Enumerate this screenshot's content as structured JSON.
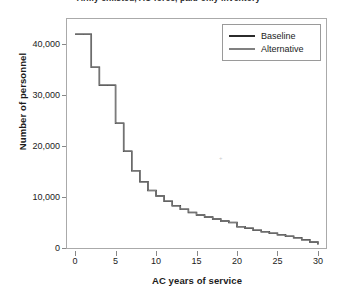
{
  "chart_data": {
    "type": "line",
    "title": "Army enlisted, AC force, paid-only inventory",
    "xlabel": "AC years of service",
    "ylabel": "Number of personnel",
    "xlim": [
      -1,
      31
    ],
    "ylim": [
      0,
      45000
    ],
    "xticks": [
      0,
      5,
      10,
      15,
      20,
      25,
      30
    ],
    "xticklabels": [
      "0",
      "5",
      "10",
      "15",
      "20",
      "25",
      "30"
    ],
    "yticks": [
      0,
      10000,
      20000,
      30000,
      40000
    ],
    "yticklabels": [
      "0",
      "10,000",
      "20,000",
      "30,000",
      "40,000"
    ],
    "grid": false,
    "drawstyle": "steps-post",
    "legend_position": "top-right",
    "x": [
      0,
      1,
      2,
      3,
      4,
      5,
      6,
      7,
      8,
      9,
      10,
      11,
      12,
      13,
      14,
      15,
      16,
      17,
      18,
      19,
      20,
      21,
      22,
      23,
      24,
      25,
      26,
      27,
      28,
      29,
      30
    ],
    "series": [
      {
        "name": "Baseline",
        "color": "#2b2b2b",
        "values": [
          42000,
          42000,
          35500,
          32000,
          32000,
          24500,
          19000,
          15200,
          13000,
          11300,
          10200,
          9200,
          8300,
          7600,
          7000,
          6500,
          6100,
          5700,
          5300,
          5000,
          4200,
          3900,
          3500,
          3200,
          2900,
          2600,
          2300,
          2000,
          1600,
          1200,
          700
        ]
      },
      {
        "name": "Alternative",
        "color": "#808080",
        "values": [
          42000,
          42000,
          35500,
          32000,
          32000,
          24500,
          19000,
          15200,
          13000,
          11300,
          10200,
          9200,
          8300,
          7600,
          7000,
          6500,
          6100,
          5700,
          5300,
          5000,
          4200,
          3900,
          3500,
          3200,
          2900,
          2600,
          2300,
          2000,
          1600,
          1200,
          700
        ]
      }
    ],
    "legend": [
      {
        "label": "Baseline",
        "color": "#2b2b2b"
      },
      {
        "label": "Alternative",
        "color": "#808080"
      }
    ]
  },
  "axes": {
    "frame_color": "#aaaaaa",
    "tick_color": "#888888",
    "text_color": "#1b1b1b"
  }
}
